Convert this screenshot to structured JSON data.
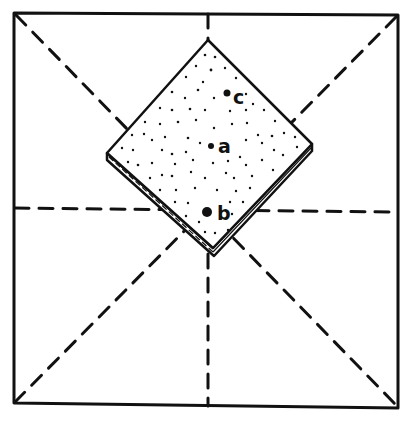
{
  "diagram": {
    "type": "hand-drawn geometric figure",
    "colors": {
      "ink": "#111111",
      "background": "#ffffff"
    },
    "outer_square": {
      "corners": [
        [
          14,
          13
        ],
        [
          398,
          15
        ],
        [
          398,
          408
        ],
        [
          14,
          403
        ]
      ]
    },
    "dashed_lines": [
      {
        "name": "diagonal-tl-br",
        "from": [
          16,
          15
        ],
        "to": [
          397,
          406
        ]
      },
      {
        "name": "diagonal-tr-bl",
        "from": [
          396,
          17
        ],
        "to": [
          16,
          401
        ]
      },
      {
        "name": "vertical-midline",
        "from": [
          208,
          14
        ],
        "to": [
          208,
          406
        ]
      },
      {
        "name": "horizontal-midline",
        "from": [
          15,
          208
        ],
        "to": [
          397,
          212
        ]
      }
    ],
    "plate": {
      "vertices": {
        "top": [
          208,
          40
        ],
        "right": [
          312,
          144
        ],
        "bottom": [
          213,
          248
        ],
        "left": [
          107,
          153
        ]
      },
      "thickness": 7,
      "texture": "stippled dots"
    },
    "points": [
      {
        "id": "c",
        "label": "c",
        "dot": [
          227,
          93
        ],
        "radius": 3.5,
        "label_pos": [
          234,
          104
        ]
      },
      {
        "id": "a",
        "label": "a",
        "dot": [
          211,
          146
        ],
        "radius": 3,
        "label_pos": [
          219,
          153
        ]
      },
      {
        "id": "b",
        "label": "b",
        "dot": [
          207,
          212
        ],
        "radius": 5,
        "label_pos": [
          219,
          220
        ]
      }
    ]
  }
}
